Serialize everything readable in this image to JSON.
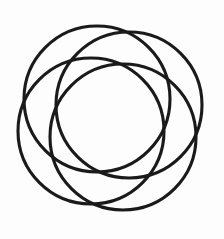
{
  "figure": {
    "type": "geometric-line-drawing",
    "background_color": "#fdfdfd",
    "stroke_color": "#1a1a1a",
    "stroke_width": 3.1,
    "canvas": {
      "width": 224,
      "height": 239
    },
    "bounding_box": {
      "left": 9,
      "top": 14,
      "right": 211,
      "bottom": 223
    },
    "composition": {
      "center_x": 110,
      "center_y": 118,
      "circle_count": 4,
      "radius": 73,
      "center_offset": 23,
      "rotation_step_degrees": 90,
      "start_angle_degrees": 235
    },
    "circles": [
      {
        "name": "circle-upper-left",
        "cx": 97,
        "cy": 99,
        "r": 73
      },
      {
        "name": "circle-upper-right",
        "cx": 129,
        "cy": 105,
        "r": 73
      },
      {
        "name": "circle-lower-right",
        "cx": 123,
        "cy": 137,
        "r": 73
      },
      {
        "name": "circle-lower-left",
        "cx": 91,
        "cy": 131,
        "r": 73
      }
    ]
  }
}
